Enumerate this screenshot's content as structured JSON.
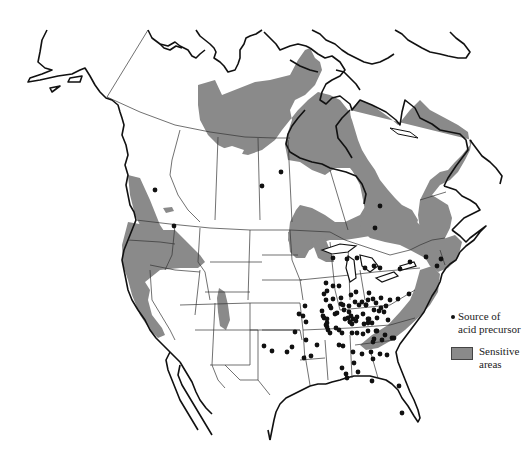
{
  "map": {
    "region": "North America (Canada, United States, northern Mexico)",
    "colors": {
      "background": "#ffffff",
      "land": "#ffffff",
      "coastline": "#111111",
      "borders": "#333333",
      "sensitive_area": "#8a8a8a",
      "source_dot": "#111111"
    }
  },
  "legend": {
    "items": [
      {
        "symbol": "dot",
        "label_line1": "Source of",
        "label_line2": "acid precursor"
      },
      {
        "symbol": "gray-swatch",
        "label_line1": "Sensitive",
        "label_line2": "areas"
      }
    ]
  },
  "sources": [
    [
      155,
      190
    ],
    [
      262,
      186
    ],
    [
      281,
      172
    ],
    [
      380,
      206
    ],
    [
      375,
      228
    ],
    [
      174,
      226
    ],
    [
      333,
      258
    ],
    [
      347,
      259
    ],
    [
      357,
      258
    ],
    [
      365,
      268
    ],
    [
      374,
      266
    ],
    [
      380,
      268
    ],
    [
      400,
      269
    ],
    [
      410,
      262
    ],
    [
      426,
      257
    ],
    [
      437,
      266
    ],
    [
      441,
      259
    ],
    [
      326,
      283
    ],
    [
      327,
      291
    ],
    [
      333,
      286
    ],
    [
      339,
      286
    ],
    [
      356,
      292
    ],
    [
      369,
      293
    ],
    [
      373,
      299
    ],
    [
      381,
      298
    ],
    [
      390,
      300
    ],
    [
      398,
      299
    ],
    [
      409,
      294
    ],
    [
      324,
      294
    ],
    [
      326,
      300
    ],
    [
      330,
      306
    ],
    [
      333,
      299
    ],
    [
      341,
      298
    ],
    [
      351,
      295
    ],
    [
      355,
      302
    ],
    [
      362,
      302
    ],
    [
      366,
      305
    ],
    [
      374,
      310
    ],
    [
      376,
      303
    ],
    [
      322,
      311
    ],
    [
      324,
      318
    ],
    [
      327,
      323
    ],
    [
      337,
      313
    ],
    [
      341,
      304
    ],
    [
      349,
      312
    ],
    [
      353,
      319
    ],
    [
      357,
      317
    ],
    [
      363,
      314
    ],
    [
      368,
      300
    ],
    [
      379,
      311
    ],
    [
      386,
      306
    ],
    [
      305,
      306
    ],
    [
      323,
      316
    ],
    [
      331,
      308
    ],
    [
      344,
      310
    ],
    [
      348,
      318
    ],
    [
      359,
      305
    ],
    [
      369,
      319
    ],
    [
      381,
      308
    ],
    [
      303,
      316
    ],
    [
      306,
      322
    ],
    [
      327,
      327
    ],
    [
      343,
      305
    ],
    [
      349,
      306
    ],
    [
      351,
      316
    ],
    [
      356,
      321
    ],
    [
      366,
      305
    ],
    [
      377,
      318
    ],
    [
      299,
      314
    ],
    [
      295,
      332
    ],
    [
      306,
      340
    ],
    [
      326,
      325
    ],
    [
      330,
      333
    ],
    [
      336,
      328
    ],
    [
      345,
      319
    ],
    [
      350,
      322
    ],
    [
      364,
      324
    ],
    [
      368,
      319
    ],
    [
      384,
      312
    ],
    [
      327,
      319
    ],
    [
      328,
      330
    ],
    [
      343,
      346
    ],
    [
      350,
      322
    ],
    [
      352,
      333
    ],
    [
      368,
      323
    ],
    [
      372,
      323
    ],
    [
      376,
      331
    ],
    [
      388,
      320
    ],
    [
      339,
      330
    ],
    [
      342,
      333
    ],
    [
      352,
      324
    ],
    [
      357,
      333
    ],
    [
      368,
      331
    ],
    [
      377,
      331
    ],
    [
      385,
      335
    ],
    [
      392,
      338
    ],
    [
      304,
      358
    ],
    [
      311,
      356
    ],
    [
      317,
      345
    ],
    [
      339,
      345
    ],
    [
      353,
      352
    ],
    [
      362,
      354
    ],
    [
      373,
      342
    ],
    [
      382,
      340
    ],
    [
      394,
      338
    ],
    [
      374,
      339
    ],
    [
      371,
      352
    ],
    [
      380,
      354
    ],
    [
      387,
      355
    ],
    [
      373,
      359
    ],
    [
      354,
      363
    ],
    [
      358,
      372
    ],
    [
      346,
      374
    ],
    [
      347,
      378
    ],
    [
      372,
      381
    ],
    [
      399,
      386
    ],
    [
      292,
      347
    ],
    [
      287,
      352
    ],
    [
      264,
      346
    ],
    [
      272,
      351
    ],
    [
      335,
      314
    ],
    [
      363,
      334
    ],
    [
      342,
      368
    ],
    [
      402,
      413
    ]
  ]
}
